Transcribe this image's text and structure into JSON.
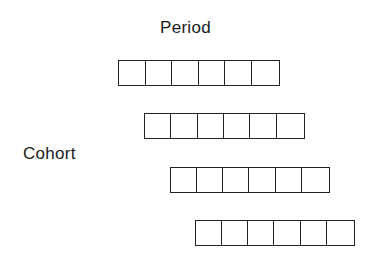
{
  "labels": {
    "period": "Period",
    "cohort": "Cohort"
  },
  "rows": [
    {
      "cells": 6,
      "x": 118,
      "y": 60,
      "w": 162
    },
    {
      "cells": 6,
      "x": 144,
      "y": 113,
      "w": 161
    },
    {
      "cells": 6,
      "x": 170,
      "y": 167,
      "w": 160
    },
    {
      "cells": 6,
      "x": 195,
      "y": 220,
      "w": 160
    }
  ]
}
